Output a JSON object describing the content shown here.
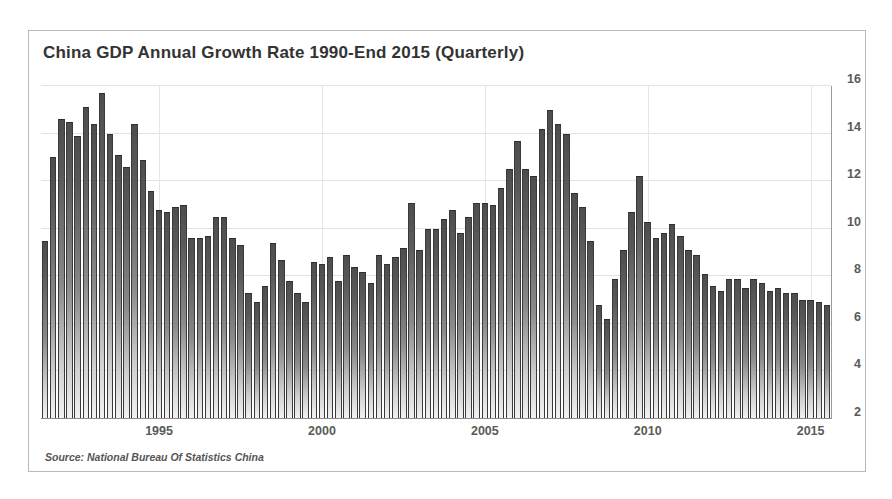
{
  "chart_title": "China GDP Annual Growth Rate 1990-End 2015 (Quarterly)",
  "source_note": "Source: National Bureau Of Statistics China",
  "colors": {
    "bar_top": "#4d4d4d",
    "bar_bottom": "#f2f2f2",
    "bar_outline": "#3a3a3a",
    "grid": "#e2e2e2",
    "axis": "#8a8a8a",
    "text": "#5a5a5a",
    "title_text": "#333333",
    "card_border": "#b8b8b8",
    "background": "#ffffff"
  },
  "chart_data": {
    "type": "bar",
    "title": "China GDP Annual Growth Rate 1990-End 2015 (Quarterly)",
    "subtitle": "",
    "xlabel": "",
    "ylabel": "",
    "source": "Source: National Bureau Of Statistics China",
    "grid": true,
    "legend": false,
    "legend_position": "none",
    "xlim": [
      "1991 Q4",
      "2015 Q4"
    ],
    "ylim": [
      2,
      16
    ],
    "ytick_labels": [
      "16",
      "14",
      "12",
      "10",
      "8",
      "6",
      "4",
      "2"
    ],
    "yticks": [
      16,
      14,
      12,
      10,
      8,
      6,
      4,
      2
    ],
    "xtick_labels": [
      "1995",
      "2000",
      "2005",
      "2010",
      "2015"
    ],
    "xticks": [
      1995,
      2000,
      2005,
      2010,
      2015
    ],
    "units": "percent year-on-year",
    "frequency": "quarterly",
    "categories": [
      "1991 Q4",
      "1992 Q1",
      "1992 Q2",
      "1992 Q3",
      "1992 Q4",
      "1993 Q1",
      "1993 Q2",
      "1993 Q3",
      "1993 Q4",
      "1994 Q1",
      "1994 Q2",
      "1994 Q3",
      "1994 Q4",
      "1995 Q1",
      "1995 Q2",
      "1995 Q3",
      "1995 Q4",
      "1996 Q1",
      "1996 Q2",
      "1996 Q3",
      "1996 Q4",
      "1997 Q1",
      "1997 Q2",
      "1997 Q3",
      "1997 Q4",
      "1998 Q1",
      "1998 Q2",
      "1998 Q3",
      "1998 Q4",
      "1999 Q1",
      "1999 Q2",
      "1999 Q3",
      "1999 Q4",
      "2000 Q1",
      "2000 Q2",
      "2000 Q3",
      "2000 Q4",
      "2001 Q1",
      "2001 Q2",
      "2001 Q3",
      "2001 Q4",
      "2002 Q1",
      "2002 Q2",
      "2002 Q3",
      "2002 Q4",
      "2003 Q1",
      "2003 Q2",
      "2003 Q3",
      "2003 Q4",
      "2004 Q1",
      "2004 Q2",
      "2004 Q3",
      "2004 Q4",
      "2005 Q1",
      "2005 Q2",
      "2005 Q3",
      "2005 Q4",
      "2006 Q1",
      "2006 Q2",
      "2006 Q3",
      "2006 Q4",
      "2007 Q1",
      "2007 Q2",
      "2007 Q3",
      "2007 Q4",
      "2008 Q1",
      "2008 Q2",
      "2008 Q3",
      "2008 Q4",
      "2009 Q1",
      "2009 Q2",
      "2009 Q3",
      "2009 Q4",
      "2010 Q1",
      "2010 Q2",
      "2010 Q3",
      "2010 Q4",
      "2011 Q1",
      "2011 Q2",
      "2011 Q3",
      "2011 Q4",
      "2012 Q1",
      "2012 Q2",
      "2012 Q3",
      "2012 Q4",
      "2013 Q1",
      "2013 Q2",
      "2013 Q3",
      "2013 Q4",
      "2014 Q1",
      "2014 Q2",
      "2014 Q3",
      "2014 Q4",
      "2015 Q1",
      "2015 Q2",
      "2015 Q3",
      "2015 Q4"
    ],
    "values": [
      9.5,
      13.0,
      14.6,
      14.5,
      13.9,
      15.1,
      14.4,
      15.7,
      14.0,
      13.1,
      12.6,
      14.4,
      12.9,
      11.6,
      10.8,
      10.7,
      10.9,
      11.0,
      9.6,
      9.6,
      9.7,
      10.5,
      10.5,
      9.6,
      9.3,
      7.3,
      6.9,
      7.6,
      9.4,
      8.7,
      7.8,
      7.3,
      6.9,
      8.6,
      8.5,
      8.8,
      7.8,
      8.9,
      8.4,
      8.2,
      7.7,
      8.9,
      8.5,
      8.8,
      9.2,
      11.1,
      9.1,
      10.0,
      10.0,
      10.4,
      10.8,
      9.8,
      10.5,
      11.1,
      11.1,
      11.0,
      11.7,
      12.5,
      13.7,
      12.5,
      12.2,
      14.2,
      15.0,
      14.4,
      14.0,
      11.5,
      10.9,
      9.5,
      6.8,
      6.2,
      7.9,
      9.1,
      10.7,
      12.2,
      10.3,
      9.6,
      9.8,
      10.2,
      9.7,
      9.1,
      8.9,
      8.1,
      7.6,
      7.4,
      7.9,
      7.9,
      7.5,
      7.9,
      7.7,
      7.4,
      7.5,
      7.3,
      7.3,
      7.0,
      7.0,
      6.9,
      6.8
    ]
  }
}
